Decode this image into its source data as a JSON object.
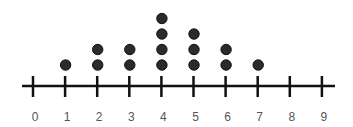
{
  "chart_data": {
    "type": "dot_plot",
    "title": "",
    "xlabel": "",
    "ylabel": "",
    "categories": [
      "0",
      "1",
      "2",
      "3",
      "4",
      "5",
      "6",
      "7",
      "8",
      "9"
    ],
    "values": [
      0,
      1,
      2,
      2,
      4,
      3,
      2,
      1,
      0,
      0
    ],
    "xlim": [
      0,
      9
    ],
    "grid": false,
    "legend": null,
    "colors": {
      "dot": "#2b2b2b",
      "axis": "#111111",
      "label": "#555555"
    }
  }
}
